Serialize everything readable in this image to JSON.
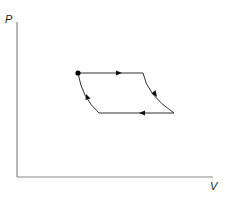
{
  "diagram": {
    "type": "PV cycle diagram",
    "axes": {
      "y_label": "P",
      "x_label": "V"
    },
    "cycle": {
      "start_point": "filled dot at top-left corner",
      "segments": [
        {
          "name": "top",
          "shape": "horizontal line",
          "direction": "left-to-right"
        },
        {
          "name": "right",
          "shape": "concave curve",
          "direction": "downward"
        },
        {
          "name": "bottom",
          "shape": "horizontal line",
          "direction": "right-to-left"
        },
        {
          "name": "left",
          "shape": "concave curve",
          "direction": "upward"
        }
      ]
    },
    "colors": {
      "axis": "#888888",
      "cycle": "#333333",
      "arrows": "#111111"
    }
  }
}
